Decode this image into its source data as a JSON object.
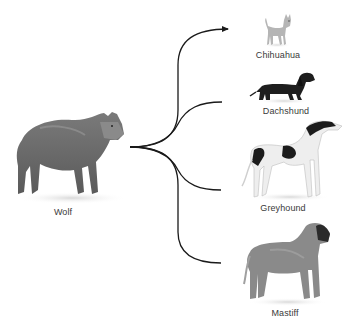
{
  "diagram": {
    "type": "branching-tree",
    "root": {
      "label": "Wolf",
      "icon": "wolf-illustration"
    },
    "branches": [
      {
        "label": "Chihuahua",
        "icon": "chihuahua-illustration",
        "arrow": true
      },
      {
        "label": "Dachshund",
        "icon": "dachshund-illustration",
        "arrow": false
      },
      {
        "label": "Greyhound",
        "icon": "greyhound-illustration",
        "arrow": false
      },
      {
        "label": "Mastiff",
        "icon": "mastiff-illustration",
        "arrow": false
      }
    ]
  },
  "colors": {
    "line": "#1a1a1a",
    "label": "#3a3a3a",
    "wolf": "#6e6e6e",
    "chihuahua": "#b5b5b5",
    "dachshund": "#1e1e1e",
    "greyhound_body": "#eeeeee",
    "greyhound_patch": "#1c1c1c",
    "mastiff": "#8a8a8a",
    "mastiff_muzzle": "#2a2a2a"
  }
}
